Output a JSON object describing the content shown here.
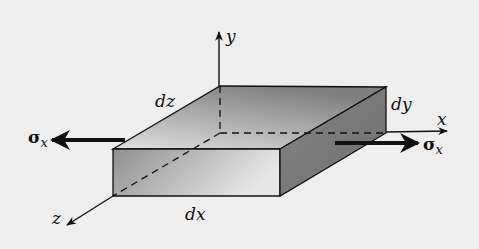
{
  "diagram": {
    "colors": {
      "background": "#eeeeee",
      "edge": "#111111",
      "top_face_light": "#d8d8d8",
      "top_face_dark": "#8a8a8a",
      "front_face_light": "#e2e2e2",
      "front_face_dark": "#8e8e8e",
      "side_face": "#7a7a7a"
    },
    "axes": {
      "x": {
        "label": "x"
      },
      "y": {
        "label": "y"
      },
      "z": {
        "label": "z"
      }
    },
    "dimensions": {
      "dx": "dx",
      "dy": "dy",
      "dz": "dz"
    },
    "stresses": {
      "left": {
        "label": "σ",
        "subscript": "x"
      },
      "right": {
        "label": "σ",
        "subscript": "x"
      }
    }
  }
}
